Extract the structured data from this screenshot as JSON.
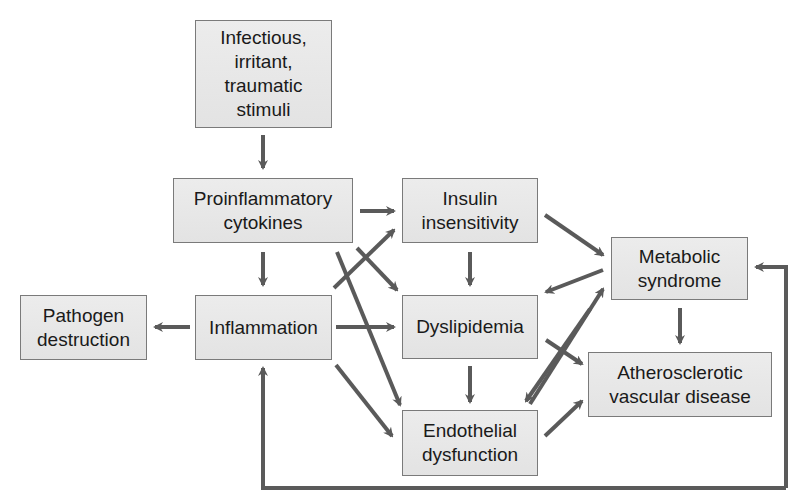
{
  "diagram": {
    "arrow_color": "#5a5a5a",
    "box_fill": "#e6e6e6",
    "box_border": "#7a7a7a",
    "nodes": {
      "stimuli": "Infectious,\nirritant,\ntraumatic\nstimuli",
      "cytokines": "Proinflammatory\ncytokines",
      "insulin": "Insulin\ninsensitivity",
      "metabolic": "Metabolic\nsyndrome",
      "pathogen": "Pathogen\ndestruction",
      "inflammation": "Inflammation",
      "dyslipidemia": "Dyslipidemia",
      "athero": "Atherosclerotic\nvascular disease",
      "endothelial": "Endothelial\ndysfunction"
    },
    "edges": [
      [
        "stimuli",
        "cytokines"
      ],
      [
        "cytokines",
        "insulin"
      ],
      [
        "cytokines",
        "inflammation"
      ],
      [
        "cytokines",
        "dyslipidemia"
      ],
      [
        "cytokines",
        "endothelial"
      ],
      [
        "inflammation",
        "pathogen"
      ],
      [
        "inflammation",
        "insulin"
      ],
      [
        "inflammation",
        "dyslipidemia"
      ],
      [
        "inflammation",
        "endothelial"
      ],
      [
        "insulin",
        "dyslipidemia"
      ],
      [
        "insulin",
        "metabolic"
      ],
      [
        "metabolic",
        "dyslipidemia"
      ],
      [
        "metabolic",
        "endothelial"
      ],
      [
        "endothelial",
        "metabolic"
      ],
      [
        "metabolic",
        "athero"
      ],
      [
        "dyslipidemia",
        "endothelial"
      ],
      [
        "dyslipidemia",
        "athero"
      ],
      [
        "endothelial",
        "athero"
      ],
      [
        "athero-loop",
        "inflammation"
      ],
      [
        "athero-loop",
        "metabolic"
      ]
    ]
  }
}
